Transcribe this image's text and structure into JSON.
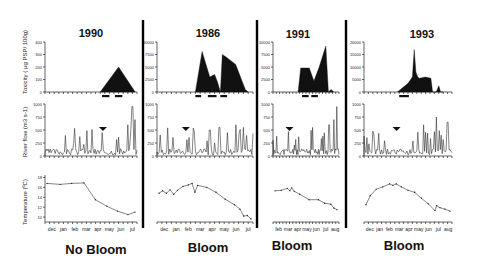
{
  "figure": {
    "y_labels": {
      "toxicity": "Toxicity ( μg PSP/ 100g)",
      "river_flow": "River flow (m3 s-1)",
      "temperature": "Temperature (ºC)"
    },
    "panels": [
      {
        "year": "1990",
        "outcome": "No Bloom"
      },
      {
        "year": "1986",
        "outcome": "Bloom"
      },
      {
        "year": "1991",
        "outcome": "Bloom"
      },
      {
        "year": "1993",
        "outcome": "Bloom"
      }
    ]
  },
  "chart_data": [
    {
      "type": "area",
      "title": "1990",
      "row": "toxicity",
      "ylabel": "Toxicity ( μg PSP/ 100g)",
      "yticks": [
        0,
        100,
        200,
        300,
        400
      ],
      "ylim": [
        0,
        400
      ],
      "x": [
        0.6,
        0.8,
        0.98
      ],
      "values": [
        0,
        200,
        0
      ],
      "bars": [
        [
          0.62,
          0.7
        ],
        [
          0.76,
          0.84
        ]
      ]
    },
    {
      "type": "area",
      "title": "1986",
      "row": "toxicity",
      "ylabel": "Toxicity ( μg PSP/ 100g)",
      "yticks": [
        0,
        2500,
        5000,
        7500,
        10000
      ],
      "ylim": [
        0,
        10000
      ],
      "x": [
        0.4,
        0.47,
        0.55,
        0.6,
        0.63,
        0.66,
        0.68,
        0.72,
        0.82,
        0.92,
        0.95
      ],
      "values": [
        0,
        8100,
        3000,
        3500,
        2000,
        0,
        7500,
        7000,
        5500,
        500,
        0
      ],
      "bars": [
        [
          0.4,
          0.46
        ],
        [
          0.53,
          0.62
        ],
        [
          0.66,
          0.73
        ]
      ]
    },
    {
      "type": "area",
      "title": "1991",
      "row": "toxicity",
      "ylabel": "Toxicity ( μg PSP/ 100g)",
      "yticks": [
        0,
        2500,
        5000,
        7500,
        10000
      ],
      "ylim": [
        0,
        10000
      ],
      "x": [
        0.38,
        0.42,
        0.55,
        0.62,
        0.7,
        0.8,
        0.84,
        0.88,
        0.92
      ],
      "values": [
        0,
        4800,
        4800,
        2200,
        5000,
        9200,
        0,
        500,
        0
      ],
      "bars": [
        [
          0.44,
          0.54
        ],
        [
          0.58,
          0.68
        ]
      ]
    },
    {
      "type": "area",
      "title": "1993",
      "row": "toxicity",
      "ylabel": "Toxicity ( μg PSP/ 100g)",
      "yticks": [
        0,
        5000,
        10000,
        15000,
        20000
      ],
      "ylim": [
        0,
        20000
      ],
      "x": [
        0.38,
        0.5,
        0.55,
        0.57,
        0.59,
        0.61,
        0.63,
        0.7,
        0.76,
        0.78,
        0.82,
        0.85,
        0.87,
        0.9
      ],
      "values": [
        0,
        3500,
        6000,
        17000,
        8000,
        6000,
        5500,
        6000,
        5500,
        0,
        0,
        2500,
        0,
        0
      ],
      "bars": [
        [
          0.4,
          0.51
        ]
      ]
    },
    {
      "type": "line",
      "row": "river_flow",
      "ylabel": "River flow (m3 s-1)",
      "yticks": [
        0,
        250,
        500,
        750,
        1000
      ],
      "ylim": [
        0,
        1000
      ],
      "note": "Four panels with spiky daily river flow series; arrow markers indicate event",
      "panels": [
        "1990",
        "1986",
        "1991",
        "1993"
      ]
    },
    {
      "type": "line",
      "title": "1990",
      "row": "temperature",
      "ylabel": "Temperature (ºC)",
      "yticks": [
        10,
        12,
        14,
        16,
        18
      ],
      "ylim": [
        9,
        18.5
      ],
      "categories": [
        "dec",
        "jan",
        "feb",
        "mar",
        "apr",
        "may",
        "jun",
        "jul"
      ],
      "x": [
        0,
        0.15,
        0.28,
        0.42,
        0.55,
        0.68,
        0.8,
        0.92,
        1.0
      ],
      "values": [
        16.8,
        16.6,
        16.8,
        16.9,
        13.5,
        12.2,
        11.2,
        10.5,
        11.0
      ]
    },
    {
      "type": "line",
      "title": "1986",
      "row": "temperature",
      "ylabel": "Temperature (ºC)",
      "categories": [
        "dec",
        "jan",
        "feb",
        "mar",
        "apr",
        "may",
        "jun",
        "jul"
      ],
      "x": [
        0,
        0.04,
        0.08,
        0.12,
        0.16,
        0.2,
        0.26,
        0.32,
        0.36,
        0.39,
        0.42,
        0.52,
        0.62,
        0.72,
        0.82,
        0.88,
        0.92,
        0.96,
        1.0
      ],
      "values": [
        14.8,
        15.3,
        14.8,
        15.5,
        14.6,
        15.4,
        16.2,
        16.5,
        16.8,
        15.0,
        16.4,
        16.0,
        15.0,
        13.6,
        12.5,
        11.6,
        10.2,
        10.3,
        9.6
      ]
    },
    {
      "type": "line",
      "title": "1991",
      "row": "temperature",
      "ylabel": "Temperature (ºC)",
      "categories": [
        "feb",
        "mar",
        "apr",
        "may",
        "jun",
        "jul",
        "aug"
      ],
      "x": [
        0,
        0.1,
        0.2,
        0.24,
        0.27,
        0.31,
        0.4,
        0.55,
        0.7,
        0.8,
        0.9,
        0.95,
        1.0
      ],
      "values": [
        15.3,
        15.4,
        15.8,
        15.3,
        15.9,
        15.2,
        14.6,
        13.5,
        13.5,
        12.8,
        12.6,
        11.8,
        11.5
      ]
    },
    {
      "type": "line",
      "title": "1993",
      "row": "temperature",
      "ylabel": "Temperature (ºC)",
      "categories": [
        "dec",
        "jan",
        "feb",
        "mar",
        "apr",
        "may",
        "jun",
        "jul",
        "aug"
      ],
      "x": [
        0,
        0.05,
        0.12,
        0.2,
        0.28,
        0.32,
        0.36,
        0.42,
        0.5,
        0.58,
        0.66,
        0.74,
        0.82,
        0.84,
        0.88,
        0.94,
        1.0
      ],
      "values": [
        12.5,
        14.3,
        15.6,
        16.1,
        16.7,
        16.4,
        16.7,
        16.1,
        15.4,
        15.0,
        13.8,
        12.7,
        11.3,
        12.3,
        11.9,
        11.6,
        11.2
      ]
    }
  ]
}
